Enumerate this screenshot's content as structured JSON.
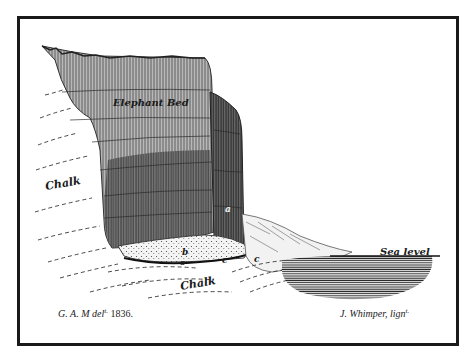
{
  "figure": {
    "labels": {
      "elephant_bed": "Elephant Bed",
      "chalk_upper": "Chalk",
      "chalk_lower": "Chalk",
      "sea_level": "Sea level",
      "a": "a",
      "b": "b",
      "o": "o",
      "c1": "c",
      "c2": "c"
    },
    "caption": {
      "left_prefix": "G. A. M del",
      "left_super": "t.",
      "left_year": "1836.",
      "right_prefix": "J. Whimper, lign",
      "right_super": "t."
    },
    "colors": {
      "ink": "#1a1a1a",
      "paper": "#ffffff",
      "cliff_light": "#9a9a9a",
      "cliff_dark": "#4a4a4a",
      "sea": "#3a3a3a"
    }
  }
}
